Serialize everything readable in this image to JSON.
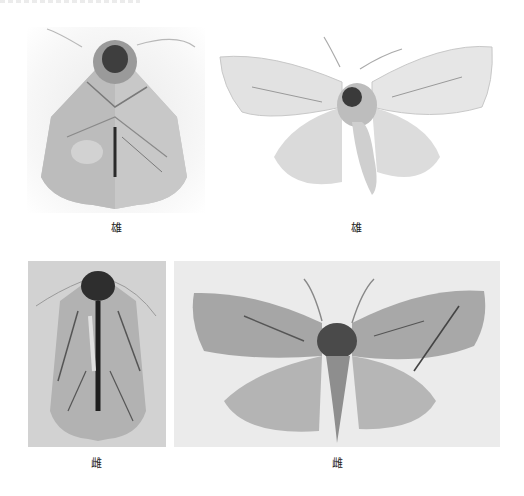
{
  "page": {
    "background": "#ffffff"
  },
  "plates": [
    {
      "id": "top-left",
      "subject": "moth-specimen-resting-dorsal",
      "sex_label": "雄",
      "background": "#f4f4f4"
    },
    {
      "id": "top-right",
      "subject": "moth-specimen-spread-wings",
      "sex_label": "雄",
      "background": "#ffffff"
    },
    {
      "id": "bottom-left",
      "subject": "moth-specimen-resting-dorsal",
      "sex_label": "雌",
      "background": "#d4d4d4"
    },
    {
      "id": "bottom-right",
      "subject": "moth-specimen-spread-wings",
      "sex_label": "雌",
      "background": "#ececec"
    }
  ],
  "captions": {
    "top_left": "雄",
    "top_right": "雄",
    "bottom_left": "雌",
    "bottom_right": "雌"
  }
}
